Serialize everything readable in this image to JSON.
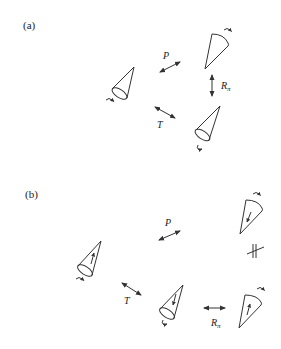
{
  "figure": {
    "panels": [
      {
        "id": "a",
        "label": "(a)",
        "operations": [
          {
            "symbol": "P",
            "subscript": "",
            "meaning": "parity"
          },
          {
            "symbol": "T",
            "subscript": "",
            "meaning": "time reversal"
          },
          {
            "symbol": "R",
            "subscript": "π",
            "meaning": "rotation by pi"
          }
        ],
        "cones": [
          {
            "position": "left",
            "spin": "curl-below"
          },
          {
            "position": "top-right",
            "spin": "curl-above"
          },
          {
            "position": "bottom-right",
            "spin": "curl-below"
          }
        ]
      },
      {
        "id": "b",
        "label": "(b)",
        "operations": [
          {
            "symbol": "P",
            "subscript": "",
            "meaning": "parity"
          },
          {
            "symbol": "T",
            "subscript": "",
            "meaning": "time reversal"
          },
          {
            "symbol": "R",
            "subscript": "π",
            "meaning": "rotation by pi"
          }
        ],
        "not_equal_symbol": "≠ (crossed parallel lines)",
        "cones": [
          {
            "position": "left",
            "inner_arrow": "toward-apex",
            "spin": "curl-below"
          },
          {
            "position": "top-right",
            "inner_arrow": "toward-apex",
            "spin": "curl-above"
          },
          {
            "position": "middle",
            "inner_arrow": "toward-base",
            "spin": "curl-below"
          },
          {
            "position": "bottom-right",
            "inner_arrow": "toward-base",
            "spin": "curl-above"
          }
        ]
      }
    ]
  },
  "labels": {
    "a": "(a)",
    "b": "(b)",
    "P": "P",
    "T": "T",
    "R": "R",
    "pi": "π"
  }
}
